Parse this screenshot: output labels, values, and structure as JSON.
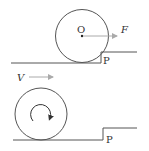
{
  "figure1": {
    "center_label": "O",
    "force_label": "F",
    "corner_label": "P",
    "colors": {
      "line": "#555555",
      "arrow": "#aaaaaa",
      "text": "#333333"
    }
  },
  "figure2": {
    "velocity_label": "V",
    "corner_label": "P",
    "rotation": "clockwise",
    "colors": {
      "line": "#555555",
      "arrow": "#aaaaaa",
      "text": "#333333"
    }
  }
}
